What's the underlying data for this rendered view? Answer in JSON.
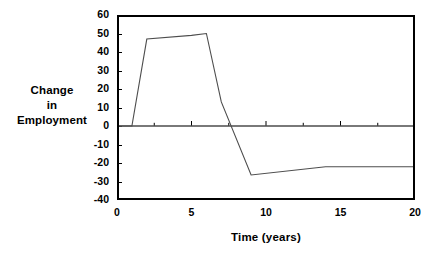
{
  "chart_data": {
    "type": "line",
    "title": "",
    "xlabel": "Time (years)",
    "ylabel": "Change in Employment",
    "ylabel_lines": [
      "Change",
      "in",
      "Employment"
    ],
    "xlim": [
      0,
      20
    ],
    "ylim": [
      -40,
      60
    ],
    "xticks": [
      0,
      5,
      10,
      15,
      20
    ],
    "xtick_labels": [
      "0",
      "5",
      "10",
      "15",
      "20"
    ],
    "x_minor_tick_step": 2.5,
    "yticks": [
      -40,
      -30,
      -20,
      -10,
      0,
      10,
      20,
      30,
      40,
      50,
      60
    ],
    "ytick_labels": [
      "-40",
      "-30",
      "-20",
      "-10",
      "0",
      "10",
      "20",
      "30",
      "40",
      "50",
      "60"
    ],
    "grid": false,
    "legend": null,
    "zero_line": 0,
    "line_color": "#4d4d4d",
    "axis_color": "#000000",
    "series": [
      {
        "name": "Change in Employment",
        "x": [
          0,
          1,
          2,
          5,
          6,
          7,
          9,
          14,
          20
        ],
        "values": [
          0,
          0,
          47,
          49,
          50,
          13,
          -26.5,
          -22,
          -22
        ]
      }
    ]
  },
  "axes": {
    "y_title_lines": [
      "Change",
      "in",
      "Employment"
    ],
    "x_title": "Time (years)"
  }
}
